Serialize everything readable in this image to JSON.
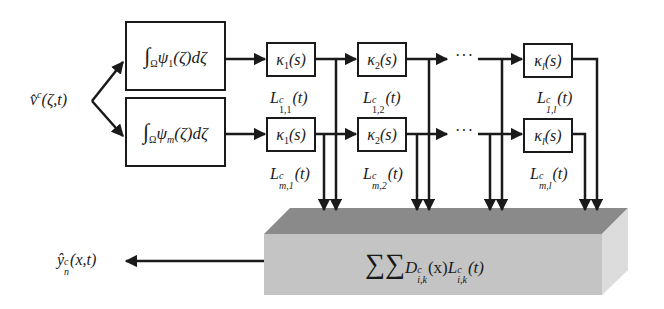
{
  "input": {
    "symbol": "v̂",
    "sup": "c",
    "args": "(ζ,t)"
  },
  "output": {
    "symbol": "ŷ",
    "sup": "c",
    "sub": "n",
    "args": "(x,t)"
  },
  "integrators": [
    {
      "int_sub": "Ω",
      "psi": "ψ",
      "psi_sub": "1",
      "tail": "(ζ)dζ"
    },
    {
      "int_sub": "Ω",
      "psi": "ψ",
      "psi_sub": "m",
      "tail": "(ζ)dζ"
    }
  ],
  "rows": [
    {
      "kappas": [
        {
          "k": "κ",
          "sub": "1",
          "sup": "c",
          "arg": "(s)"
        },
        {
          "k": "κ",
          "sub": "2",
          "sup": "",
          "arg": "(s)"
        },
        {
          "k": "κ",
          "sub": "l",
          "sup": "",
          "arg": "(s)"
        }
      ],
      "signals": [
        {
          "L": "L",
          "sup": "c",
          "sub": "1,1",
          "arg": "(t)"
        },
        {
          "L": "L",
          "sup": "c",
          "sub": "1,2",
          "arg": "(t)"
        },
        {
          "L": "L",
          "sup": "c",
          "sub": "1,l",
          "arg": "(t)"
        }
      ],
      "ellipsis": "···"
    },
    {
      "kappas": [
        {
          "k": "κ",
          "sub": "1",
          "sup": "",
          "arg": "(s)"
        },
        {
          "k": "κ",
          "sub": "2",
          "sup": "",
          "arg": "(s)"
        },
        {
          "k": "κ",
          "sub": "l",
          "sup": "",
          "arg": "(s)"
        }
      ],
      "signals": [
        {
          "L": "L",
          "sup": "c",
          "sub": "m,1",
          "arg": "(t)"
        },
        {
          "L": "L",
          "sup": "c",
          "sub": "m,2",
          "arg": "(t)"
        },
        {
          "L": "L",
          "sup": "c",
          "sub": "m,l",
          "arg": "(t)"
        }
      ],
      "ellipsis": "···"
    }
  ],
  "summation": {
    "sigma": "∑∑",
    "D": "D",
    "D_sup": "c",
    "D_sub": "i,k",
    "D_arg": "(x)",
    "L": "L",
    "L_sup": "c",
    "L_sub": "i,k",
    "L_arg": "(t)"
  },
  "colors": {
    "line": "#1a1a1a",
    "block_top": "#8a8a8a",
    "block_front": "#c4c4c4",
    "block_side": "#dcdcdc"
  }
}
